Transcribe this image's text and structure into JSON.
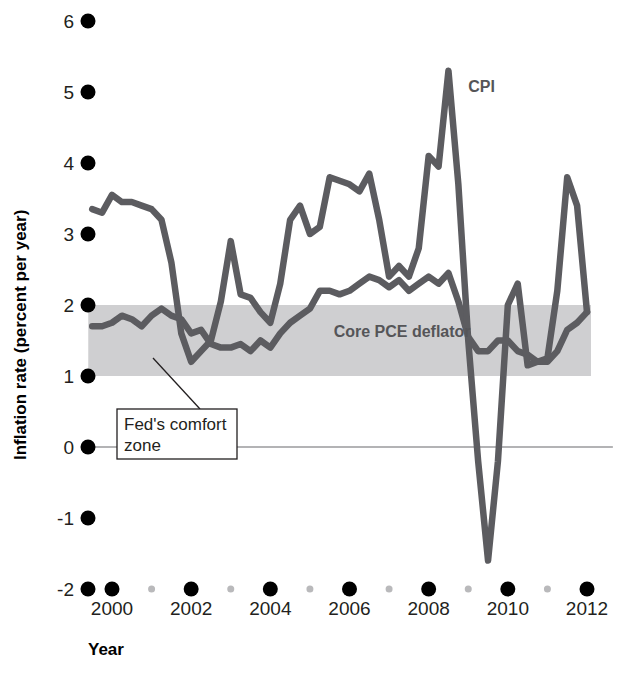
{
  "chart_data": {
    "type": "line",
    "title": "",
    "xlabel": "Year",
    "ylabel": "Inflation rate (percent per year)",
    "xlim": [
      1999.4,
      2012.3
    ],
    "ylim": [
      -2,
      6
    ],
    "grid": false,
    "legend_position": "inline-labels",
    "x_ticks_major": [
      2000,
      2002,
      2004,
      2006,
      2008,
      2010,
      2012
    ],
    "x_ticks_minor": [
      2001,
      2003,
      2005,
      2007,
      2009,
      2011
    ],
    "y_ticks": [
      6,
      5,
      4,
      3,
      2,
      1,
      0,
      -1,
      -2
    ],
    "y_tick_labels": [
      "6",
      "5",
      "4",
      "3",
      "2",
      "1",
      "0",
      "-1",
      "-2"
    ],
    "shaded_band": {
      "label": "Fed's comfort zone",
      "y_range": [
        1,
        2
      ],
      "x_range": [
        1999.4,
        2012.1
      ],
      "color": "#cfcfd1"
    },
    "annotations": [
      {
        "text_line1": "Fed's comfort",
        "text_line2": "zone",
        "target": "shaded-band"
      }
    ],
    "series": [
      {
        "name": "CPI",
        "color": "#5c5c60",
        "label_x": 2009.0,
        "label_y": 5.0,
        "x": [
          1999.5,
          1999.75,
          2000.0,
          2000.25,
          2000.5,
          2000.75,
          2001.0,
          2001.25,
          2001.5,
          2001.75,
          2002.0,
          2002.25,
          2002.5,
          2002.75,
          2003.0,
          2003.25,
          2003.5,
          2003.75,
          2004.0,
          2004.25,
          2004.5,
          2004.75,
          2005.0,
          2005.25,
          2005.5,
          2005.75,
          2006.0,
          2006.25,
          2006.5,
          2006.75,
          2007.0,
          2007.25,
          2007.5,
          2007.75,
          2008.0,
          2008.25,
          2008.5,
          2008.75,
          2009.0,
          2009.25,
          2009.5,
          2009.75,
          2010.0,
          2010.25,
          2010.5,
          2010.75,
          2011.0,
          2011.25,
          2011.5,
          2011.75,
          2012.0
        ],
        "y": [
          3.35,
          3.3,
          3.55,
          3.45,
          3.45,
          3.4,
          3.35,
          3.2,
          2.6,
          1.6,
          1.2,
          1.35,
          1.5,
          2.05,
          2.9,
          2.15,
          2.1,
          1.9,
          1.75,
          2.3,
          3.2,
          3.4,
          3.0,
          3.1,
          3.8,
          3.75,
          3.7,
          3.6,
          3.85,
          3.2,
          2.4,
          2.55,
          2.4,
          2.8,
          4.1,
          3.95,
          5.3,
          3.7,
          1.5,
          -0.2,
          -1.6,
          -0.2,
          2.0,
          2.3,
          1.15,
          1.2,
          1.25,
          2.2,
          3.8,
          3.4,
          1.9
        ]
      },
      {
        "name": "Core PCE deflator",
        "color": "#5c5c60",
        "label_x": 2005.6,
        "label_y": 1.55,
        "x": [
          1999.5,
          1999.75,
          2000.0,
          2000.25,
          2000.5,
          2000.75,
          2001.0,
          2001.25,
          2001.5,
          2001.75,
          2002.0,
          2002.25,
          2002.5,
          2002.75,
          2003.0,
          2003.25,
          2003.5,
          2003.75,
          2004.0,
          2004.25,
          2004.5,
          2004.75,
          2005.0,
          2005.25,
          2005.5,
          2005.75,
          2006.0,
          2006.25,
          2006.5,
          2006.75,
          2007.0,
          2007.25,
          2007.5,
          2007.75,
          2008.0,
          2008.25,
          2008.5,
          2008.75,
          2009.0,
          2009.25,
          2009.5,
          2009.75,
          2010.0,
          2010.25,
          2010.5,
          2010.75,
          2011.0,
          2011.25,
          2011.5,
          2011.75,
          2012.0
        ],
        "y": [
          1.7,
          1.7,
          1.75,
          1.85,
          1.8,
          1.7,
          1.85,
          1.95,
          1.85,
          1.8,
          1.6,
          1.65,
          1.45,
          1.4,
          1.4,
          1.45,
          1.35,
          1.5,
          1.4,
          1.6,
          1.75,
          1.85,
          1.95,
          2.2,
          2.2,
          2.15,
          2.2,
          2.3,
          2.4,
          2.35,
          2.25,
          2.35,
          2.2,
          2.3,
          2.4,
          2.3,
          2.45,
          2.05,
          1.55,
          1.35,
          1.35,
          1.5,
          1.5,
          1.35,
          1.3,
          1.2,
          1.2,
          1.35,
          1.65,
          1.75,
          1.9
        ]
      }
    ]
  },
  "axes": {
    "y_title": "Inflation rate (percent per year)",
    "x_title": "Year",
    "y_labels": [
      "6",
      "5",
      "4",
      "3",
      "2",
      "1",
      "0",
      "-1",
      "-2"
    ],
    "x_labels": [
      "2000",
      "2002",
      "2004",
      "2006",
      "2008",
      "2010",
      "2012"
    ]
  },
  "labels": {
    "cpi": "CPI",
    "core_pce": "Core PCE deflator",
    "callout_line1": "Fed's comfort",
    "callout_line2": "zone"
  },
  "colors": {
    "line": "#5c5c60",
    "band": "#cfcfd1",
    "tick_major": "#000000",
    "tick_minor": "#b9b9bb",
    "zero_line": "#9a9a9c",
    "text": "#231f20"
  }
}
